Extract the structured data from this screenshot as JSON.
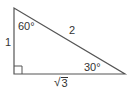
{
  "diagram": {
    "type": "right-triangle",
    "stroke_color": "#555555",
    "text_color": "#333333",
    "vertices": {
      "top": [
        14,
        8
      ],
      "right_angle": [
        14,
        74
      ],
      "right": [
        125,
        74
      ]
    },
    "angles": {
      "top": "60°",
      "right": "30°",
      "right_angle_marker": "square"
    },
    "sides": {
      "vertical_leg": "1",
      "hypotenuse": "2",
      "horizontal_leg_radical": "√",
      "horizontal_leg_radicand": "3"
    }
  }
}
